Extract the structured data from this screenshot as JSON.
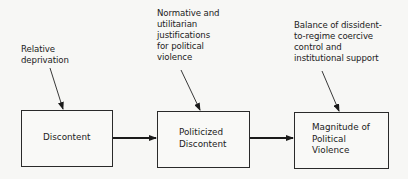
{
  "diagram": {
    "type": "flow",
    "inputs": [
      {
        "id": "input-1",
        "text": "Relative\ndeprivation",
        "target": "box-1"
      },
      {
        "id": "input-2",
        "text": "Normative and\nutilitarian\njustifications\nfor political\nviolence",
        "target": "box-2"
      },
      {
        "id": "input-3",
        "text": "Balance of dissident-\nto-regime coercive\ncontrol and\ninstitutional support",
        "target": "box-3"
      }
    ],
    "boxes": [
      {
        "id": "box-1",
        "text": "Discontent"
      },
      {
        "id": "box-2",
        "text": "Politicized\nDiscontent"
      },
      {
        "id": "box-3",
        "text": "Magnitude of\nPolitical\nViolence"
      }
    ],
    "edges": [
      {
        "from": "box-1",
        "to": "box-2"
      },
      {
        "from": "box-2",
        "to": "box-3"
      }
    ]
  }
}
